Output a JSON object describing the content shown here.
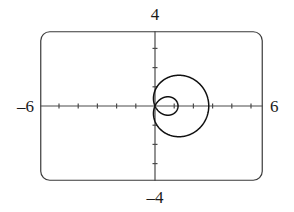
{
  "figure": {
    "kind": "graphing-calculator-plot",
    "background_color": "#ffffff",
    "frame": {
      "name": "calculator-screen-border",
      "stroke_color": "#3a3a3a",
      "corner_radius": 9,
      "x": 40,
      "y": 31,
      "width": 223,
      "height": 150
    }
  },
  "axes": {
    "x_axis_label_left": "–6",
    "x_axis_label_right": "6",
    "y_axis_label_top": "4",
    "y_axis_label_bottom": "–4",
    "x_range": [
      -6,
      6
    ],
    "y_range": [
      -4,
      4
    ],
    "x_tick_step": 1,
    "y_tick_step": 1,
    "axis_color": "#4a4a4a",
    "tick_length": 5,
    "grid": false,
    "origin_px": {
      "x": 155,
      "y": 106
    },
    "pixels_per_unit_x": 19.2,
    "pixels_per_unit_y": 19.2
  },
  "chart_data": {
    "type": "line",
    "title": "",
    "subtitle": "",
    "xlabel": "",
    "ylabel": "",
    "xlim": [
      -6,
      6
    ],
    "ylim": [
      -4,
      4
    ],
    "grid": false,
    "legend_position": "none",
    "curve_name": "limacon-with-inner-loop",
    "polar_equation": "r = 0.8 + 2.0 cos(theta)",
    "curve_color": "#111111",
    "curve_width": 1.5,
    "features": {
      "inner_loop": true,
      "inner_loop_side": "left",
      "x_intercept_right": 2.8,
      "x_intercept_left_outer": -1.2,
      "inner_loop_x_extent": [
        -4.0,
        -1.8
      ],
      "self_intersection_point": [
        -1.85,
        0.0
      ],
      "max_y": 1.55,
      "min_y": -1.55,
      "leftmost_x": -4.0,
      "rightmost_x": 2.95
    },
    "series": [
      {
        "name": "limacon",
        "theta_start_deg": 0,
        "theta_end_deg": 360,
        "x": [
          2.95,
          2.9,
          2.76,
          2.54,
          2.25,
          1.92,
          1.55,
          1.17,
          0.79,
          0.42,
          0.08,
          -0.23,
          -0.5,
          -0.74,
          -0.94,
          -1.11,
          -1.25,
          -1.37,
          -1.47,
          -1.56,
          -1.65,
          -1.74,
          -1.84,
          -1.95,
          -2.08,
          -2.24,
          -2.43,
          -2.65,
          -2.9,
          -3.17,
          -3.45,
          -3.7,
          -3.9,
          -4.0,
          -3.98,
          -3.82,
          -3.52,
          -3.1,
          -2.6,
          -2.08,
          -1.85,
          -2.08,
          -2.6,
          -3.1,
          -3.52,
          -3.82,
          -3.98,
          -4.0,
          -3.9,
          -3.7,
          -3.45,
          -3.17,
          -2.9,
          -2.65,
          -2.43,
          -2.24,
          -2.08,
          -1.95,
          -1.84,
          -1.74,
          -1.65,
          -1.56,
          -1.47,
          -1.37,
          -1.25,
          -1.11,
          -0.94,
          -0.74,
          -0.5,
          -0.23,
          0.08,
          0.42,
          0.79,
          1.17,
          1.55,
          1.92,
          2.25,
          2.54,
          2.76,
          2.9,
          2.95
        ],
        "y": [
          0.0,
          0.26,
          0.51,
          0.75,
          0.96,
          1.15,
          1.3,
          1.42,
          1.5,
          1.54,
          1.55,
          1.52,
          1.46,
          1.37,
          1.26,
          1.13,
          0.99,
          0.85,
          0.7,
          0.55,
          0.41,
          0.27,
          0.14,
          0.02,
          -0.09,
          -0.18,
          -0.25,
          -0.29,
          -0.3,
          -0.27,
          -0.2,
          -0.09,
          0.06,
          0.25,
          0.46,
          0.67,
          0.86,
          1.0,
          1.05,
          0.85,
          0.0,
          -0.85,
          -1.05,
          -1.0,
          -0.86,
          -0.67,
          -0.46,
          -0.25,
          -0.06,
          0.09,
          0.2,
          0.27,
          0.3,
          0.29,
          0.25,
          0.18,
          0.09,
          -0.02,
          -0.14,
          -0.27,
          -0.41,
          -0.55,
          -0.7,
          -0.85,
          -0.99,
          -1.13,
          -1.26,
          -1.37,
          -1.46,
          -1.52,
          -1.55,
          -1.54,
          -1.5,
          -1.42,
          -1.3,
          -1.15,
          -0.96,
          -0.75,
          -0.51,
          -0.26,
          0.0
        ]
      }
    ]
  }
}
